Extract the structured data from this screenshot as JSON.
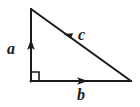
{
  "figure": {
    "type": "right-triangle-vector-diagram",
    "background_color": "#ffffff",
    "stroke_color": "#1a1a1a",
    "canvas": {
      "width": 140,
      "height": 107
    },
    "vertices": {
      "apex": {
        "x": 31,
        "y": 9
      },
      "right_angle": {
        "x": 31,
        "y": 81
      },
      "base_right": {
        "x": 131,
        "y": 81
      }
    },
    "right_angle_marker": {
      "name": "right-angle-square",
      "x": 31,
      "y": 72,
      "size": 8,
      "visible": true
    },
    "vectors": [
      {
        "label": "a",
        "name": "vector-a",
        "side": "vertical-leg",
        "from": {
          "x": 31,
          "y": 81
        },
        "to": {
          "x": 31,
          "y": 9
        },
        "direction": "up",
        "arrowhead_at": {
          "x": 31,
          "y": 46
        },
        "label_position": {
          "x": 13,
          "y": 49
        }
      },
      {
        "label": "b",
        "name": "vector-b",
        "side": "horizontal-leg",
        "from": {
          "x": 31,
          "y": 81
        },
        "to": {
          "x": 131,
          "y": 81
        },
        "direction": "right",
        "arrowhead_at": {
          "x": 81,
          "y": 81
        },
        "label_position": {
          "x": 83,
          "y": 95
        }
      },
      {
        "label": "c",
        "name": "vector-c",
        "side": "hypotenuse",
        "from": {
          "x": 131,
          "y": 81
        },
        "to": {
          "x": 31,
          "y": 9
        },
        "direction": "up-left",
        "arrowhead_at": {
          "x": 68,
          "y": 37
        },
        "label_position": {
          "x": 84,
          "y": 35
        }
      }
    ]
  }
}
